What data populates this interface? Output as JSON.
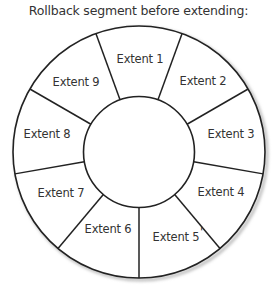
{
  "title": "Rollback segment before extending:",
  "diagram": {
    "type": "ring-segments",
    "center": [
      139,
      152
    ],
    "outer_radius": 126,
    "inner_radius": 55.5,
    "stroke_color": "#222222",
    "shadow_color": "#bdbdbd",
    "spoke_angles_deg": [
      10,
      50,
      90,
      130,
      170,
      210,
      250,
      290,
      330
    ],
    "segments": [
      {
        "label": "Extent 1",
        "pos": [
          140,
          63
        ]
      },
      {
        "label": "Extent 2",
        "pos": [
          203,
          85
        ]
      },
      {
        "label": "Extent 3",
        "pos": [
          231,
          138
        ]
      },
      {
        "label": "Extent 4",
        "pos": [
          221,
          196
        ]
      },
      {
        "label": "Extent 5",
        "pos": [
          176,
          241
        ]
      },
      {
        "label": "Extent 6",
        "pos": [
          108,
          233
        ]
      },
      {
        "label": "Extent 7",
        "pos": [
          61,
          197
        ]
      },
      {
        "label": "Extent 8",
        "pos": [
          47,
          138
        ]
      },
      {
        "label": "Extent 9",
        "pos": [
          76,
          86
        ]
      }
    ],
    "artifact_mark": "'"
  }
}
